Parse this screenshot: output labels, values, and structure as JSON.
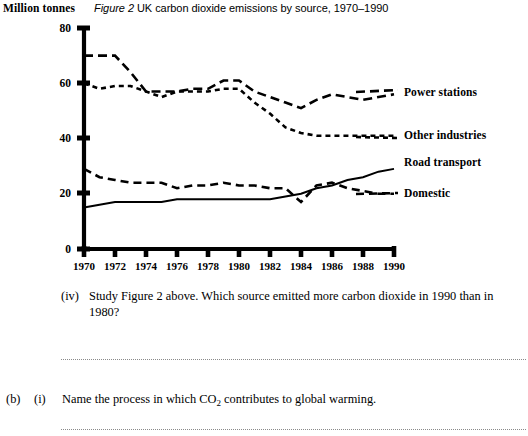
{
  "figure": {
    "y_axis_unit": "Million tonnes",
    "caption_figure_number": "Figure 2",
    "caption_text": "UK carbon dioxide emissions by source, 1970–1990"
  },
  "legend": {
    "power_stations": "Power stations",
    "other_industries": "Other industries",
    "road_transport": "Road transport",
    "domestic": "Domestic"
  },
  "questions": {
    "q_iv_marker": "(iv)",
    "q_iv_text": "Study Figure 2 above. Which source emitted more carbon dioxide in 1990 than in 1980?",
    "q_b_marker": "(b)",
    "q_i_marker": "(i)",
    "q_b_i_text_before": "Name the process in which CO",
    "q_b_i_subscript": "2",
    "q_b_i_text_after": " contributes to global warming."
  },
  "chart_data": {
    "type": "line",
    "xlabel": "",
    "ylabel": "Million tonnes",
    "xlim": [
      1970,
      1990
    ],
    "ylim": [
      0,
      80
    ],
    "yticks": [
      0,
      20,
      40,
      60,
      80
    ],
    "ytick_labels": [
      "0",
      "20",
      "40",
      "60",
      "80"
    ],
    "xticks": [
      1970,
      1972,
      1974,
      1976,
      1978,
      1980,
      1982,
      1984,
      1986,
      1988,
      1990
    ],
    "xtick_labels": [
      "1970",
      "1972",
      "1974",
      "1976",
      "1978",
      "1980",
      "1982",
      "1984",
      "1986",
      "1988",
      "1990"
    ],
    "grid": false,
    "legend_position": "right",
    "x": [
      1970,
      1971,
      1972,
      1973,
      1974,
      1975,
      1976,
      1977,
      1978,
      1979,
      1980,
      1981,
      1982,
      1983,
      1984,
      1985,
      1986,
      1987,
      1988,
      1989,
      1990
    ],
    "series": [
      {
        "name": "Power stations",
        "dash": "long-dash",
        "values": [
          70,
          70,
          70,
          64,
          57,
          57,
          57,
          58,
          58,
          61,
          61,
          57,
          55,
          53,
          51,
          54,
          56,
          55,
          54,
          55,
          56
        ]
      },
      {
        "name": "Other industries",
        "dash": "short-dash",
        "values": [
          60,
          58,
          59,
          59,
          57,
          55,
          57,
          57,
          57,
          58,
          58,
          53,
          49,
          44,
          42,
          41,
          41,
          41,
          41,
          41,
          41
        ]
      },
      {
        "name": "Road transport",
        "dash": "solid",
        "values": [
          15,
          16,
          17,
          17,
          17,
          17,
          18,
          18,
          18,
          18,
          18,
          18,
          18,
          19,
          20,
          22,
          23,
          25,
          26,
          28,
          29
        ]
      },
      {
        "name": "Domestic",
        "dash": "medium-dash",
        "values": [
          29,
          26,
          25,
          24,
          24,
          24,
          22,
          23,
          23,
          24,
          23,
          23,
          22,
          22,
          17,
          23,
          24,
          22,
          21,
          20,
          20
        ]
      }
    ]
  }
}
